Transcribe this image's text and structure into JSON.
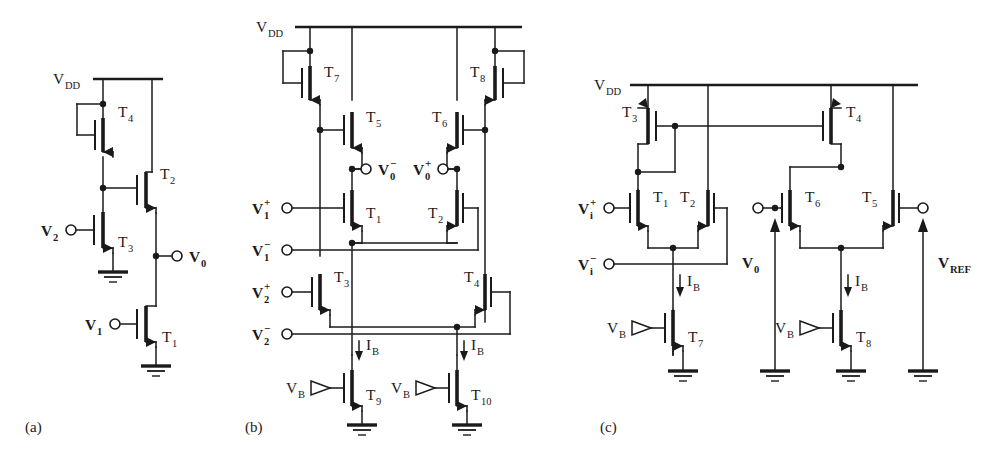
{
  "figure": {
    "type": "circuit-schematic",
    "background_color": "#ffffff",
    "line_color": "#1a1a1a"
  },
  "subfigures": [
    {
      "key": "a",
      "label": "(a)",
      "x": 25,
      "y": 428
    },
    {
      "key": "b",
      "label": "(b)",
      "x": 245,
      "y": 428
    },
    {
      "key": "c",
      "label": "(c)",
      "x": 600,
      "y": 428
    }
  ],
  "circuit_a": {
    "name": "two-input-cmos-gate",
    "supply_label": "V",
    "supply_sub": "DD",
    "transistors": [
      {
        "id": "T4",
        "label": "T",
        "sub": "4",
        "kind": "pmos-diode"
      },
      {
        "id": "T3",
        "label": "T",
        "sub": "3",
        "kind": "nmos"
      },
      {
        "id": "T2",
        "label": "T",
        "sub": "2",
        "kind": "nmos"
      },
      {
        "id": "T1",
        "label": "T",
        "sub": "1",
        "kind": "nmos"
      }
    ],
    "ports": [
      {
        "id": "V2",
        "label": "V",
        "sub": "2",
        "sup": "",
        "side": "left"
      },
      {
        "id": "V1",
        "label": "V",
        "sub": "1",
        "sup": "",
        "side": "left"
      },
      {
        "id": "V0",
        "label": "V",
        "sub": "0",
        "sup": "",
        "side": "right"
      }
    ]
  },
  "circuit_b": {
    "name": "differential-four-input-amplifier",
    "supply_label": "V",
    "supply_sub": "DD",
    "transistors": [
      {
        "id": "T7",
        "label": "T",
        "sub": "7",
        "kind": "pmos-diode"
      },
      {
        "id": "T8",
        "label": "T",
        "sub": "8",
        "kind": "pmos-diode"
      },
      {
        "id": "T5",
        "label": "T",
        "sub": "5",
        "kind": "pmos"
      },
      {
        "id": "T6",
        "label": "T",
        "sub": "6",
        "kind": "pmos"
      },
      {
        "id": "T1",
        "label": "T",
        "sub": "1",
        "kind": "nmos"
      },
      {
        "id": "T2",
        "label": "T",
        "sub": "2",
        "kind": "nmos"
      },
      {
        "id": "T3",
        "label": "T",
        "sub": "3",
        "kind": "nmos"
      },
      {
        "id": "T4",
        "label": "T",
        "sub": "4",
        "kind": "nmos"
      },
      {
        "id": "T9",
        "label": "T",
        "sub": "9",
        "kind": "nmos"
      },
      {
        "id": "T10",
        "label": "T",
        "sub": "10",
        "kind": "nmos"
      }
    ],
    "ports": [
      {
        "id": "V1p",
        "label": "V",
        "sub": "1",
        "sup": "+"
      },
      {
        "id": "V1n",
        "label": "V",
        "sub": "1",
        "sup": "−"
      },
      {
        "id": "V2p",
        "label": "V",
        "sub": "2",
        "sup": "+"
      },
      {
        "id": "V2n",
        "label": "V",
        "sub": "2",
        "sup": "−"
      },
      {
        "id": "V0n",
        "label": "V",
        "sub": "0",
        "sup": "−"
      },
      {
        "id": "V0p",
        "label": "V",
        "sub": "0",
        "sup": "+"
      }
    ],
    "bias": [
      {
        "id": "VB_left",
        "label": "V",
        "sub": "B"
      },
      {
        "id": "VB_right",
        "label": "V",
        "sub": "B"
      }
    ],
    "currents": [
      {
        "id": "IB_left",
        "label": "I",
        "sub": "B",
        "direction": "down"
      },
      {
        "id": "IB_right",
        "label": "I",
        "sub": "B",
        "direction": "down"
      }
    ]
  },
  "circuit_c": {
    "name": "differential-comparator-with-reference",
    "supply_label": "V",
    "supply_sub": "DD",
    "transistors": [
      {
        "id": "T3",
        "label": "T",
        "sub": "3",
        "kind": "pmos-diode"
      },
      {
        "id": "T4",
        "label": "T",
        "sub": "4",
        "kind": "pmos"
      },
      {
        "id": "T1",
        "label": "T",
        "sub": "1",
        "kind": "nmos"
      },
      {
        "id": "T2",
        "label": "T",
        "sub": "2",
        "kind": "nmos"
      },
      {
        "id": "T6",
        "label": "T",
        "sub": "6",
        "kind": "nmos"
      },
      {
        "id": "T5",
        "label": "T",
        "sub": "5",
        "kind": "nmos"
      },
      {
        "id": "T7",
        "label": "T",
        "sub": "7",
        "kind": "nmos"
      },
      {
        "id": "T8",
        "label": "T",
        "sub": "8",
        "kind": "nmos"
      }
    ],
    "ports": [
      {
        "id": "Vip",
        "label": "V",
        "sub": "i",
        "sup": "+"
      },
      {
        "id": "Vin",
        "label": "V",
        "sub": "i",
        "sup": "−"
      },
      {
        "id": "V0",
        "label": "V",
        "sub": "0",
        "sup": "",
        "source": "arrow-up"
      },
      {
        "id": "VREF",
        "label": "V",
        "sub": "REF",
        "sup": "",
        "source": "arrow-up"
      }
    ],
    "bias": [
      {
        "id": "VB_left",
        "label": "V",
        "sub": "B"
      },
      {
        "id": "VB_right",
        "label": "V",
        "sub": "B"
      }
    ],
    "currents": [
      {
        "id": "IB_left",
        "label": "I",
        "sub": "B",
        "direction": "down"
      },
      {
        "id": "IB_right",
        "label": "I",
        "sub": "B",
        "direction": "down"
      }
    ]
  }
}
